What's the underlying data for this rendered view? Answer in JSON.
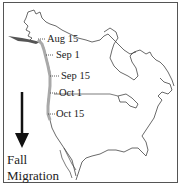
{
  "map": {
    "title": "Fall Migration",
    "route_color": "#a9a9a9",
    "wintering_color": "#555555",
    "outline_color": "#444444",
    "date_markers": [
      {
        "label": "Aug 15"
      },
      {
        "label": "Sep 1"
      },
      {
        "label": "Sep 15"
      },
      {
        "label": "Oct 1"
      },
      {
        "label": "Oct 15"
      }
    ],
    "legend": {
      "line1": "Fall",
      "line2": "Migration",
      "arrow_direction": "down"
    }
  }
}
